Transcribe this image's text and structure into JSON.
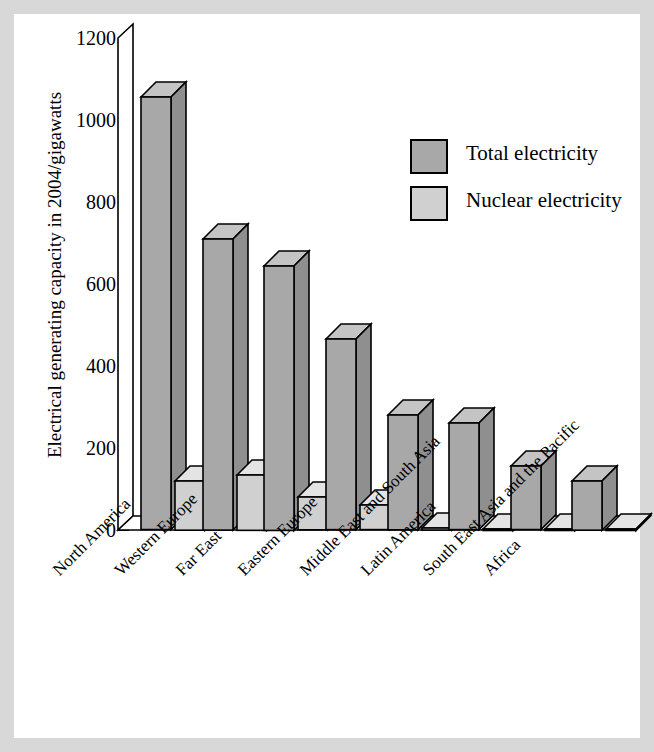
{
  "figure": {
    "background_color": "#d8d8d8",
    "panel_color": "#ffffff"
  },
  "chart_data": {
    "type": "bar",
    "title": "",
    "subtitle": "",
    "xlabel": "",
    "ylabel": "Electrical generating capacity in 2004/gigawatts",
    "ylim": [
      0,
      1200
    ],
    "yticks": [
      0,
      200,
      400,
      600,
      800,
      1000,
      1200
    ],
    "ytick_labels": [
      "0",
      "200",
      "400",
      "600",
      "800",
      "1000",
      "1200"
    ],
    "grid": false,
    "legend_position": "upper-right-inside",
    "style": "3d-bar",
    "categories": [
      "North America",
      "Western Europe",
      "Far East",
      "Eastern Europe",
      "Middle East and South Asia",
      "Latin America",
      "South East Asia and the Pacific",
      "Africa"
    ],
    "series": [
      {
        "name": "Total electricity",
        "color": "#a8a8a8",
        "values": [
          1055,
          710,
          645,
          465,
          280,
          260,
          155,
          120
        ]
      },
      {
        "name": "Nuclear electricity",
        "color": "#d0d0d0",
        "values": [
          120,
          135,
          80,
          60,
          5,
          3,
          3,
          2
        ]
      }
    ]
  },
  "legend": {
    "items": [
      {
        "label": "Total electricity",
        "color": "#a8a8a8"
      },
      {
        "label": "Nuclear electricity",
        "color": "#d0d0d0"
      }
    ]
  },
  "colors": {
    "total_face": "#a8a8a8",
    "total_top": "#c4c4c4",
    "total_side": "#8f8f8f",
    "nuclear_face": "#d0d0d0",
    "nuclear_top": "#e4e4e4",
    "nuclear_side": "#bdbdbd",
    "outline": "#000000",
    "page_border": "#d8d8d8"
  }
}
